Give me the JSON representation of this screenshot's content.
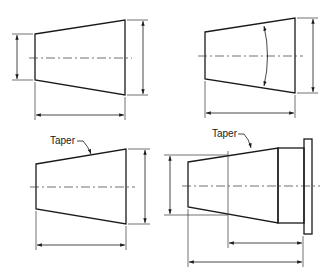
{
  "figure": {
    "colors": {
      "line": "#1a1a1a",
      "background": "#ffffff"
    }
  },
  "views": [
    {
      "id": "top-left",
      "type": "taper",
      "dimensions": [
        "small-diameter",
        "large-diameter",
        "length"
      ],
      "label": ""
    },
    {
      "id": "top-right",
      "type": "taper",
      "dimensions": [
        "taper-angle",
        "large-diameter",
        "length"
      ],
      "label": ""
    },
    {
      "id": "bottom-left",
      "type": "taper",
      "dimensions": [
        "large-diameter",
        "length"
      ],
      "label": "Taper"
    },
    {
      "id": "bottom-right",
      "type": "taper-with-flange",
      "dimensions": [
        "gauge-diameter",
        "gauge-location",
        "overall-length"
      ],
      "label": "Taper"
    }
  ],
  "labels": {
    "taper_bottom_left": "Taper",
    "taper_bottom_right": "Taper"
  }
}
